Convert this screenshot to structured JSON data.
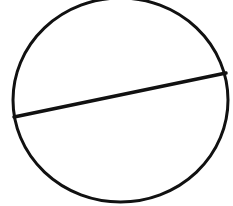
{
  "diagram": {
    "type": "circle-with-chord",
    "background": "#ffffff",
    "stroke_color": "#111111",
    "circle": {
      "cx": 120.5,
      "cy": 100,
      "rx": 107.5,
      "ry": 102,
      "stroke_width": 3
    },
    "chord": {
      "x1": 14,
      "y1": 117,
      "x2": 226,
      "y2": 73,
      "stroke_width": 3.5
    }
  }
}
